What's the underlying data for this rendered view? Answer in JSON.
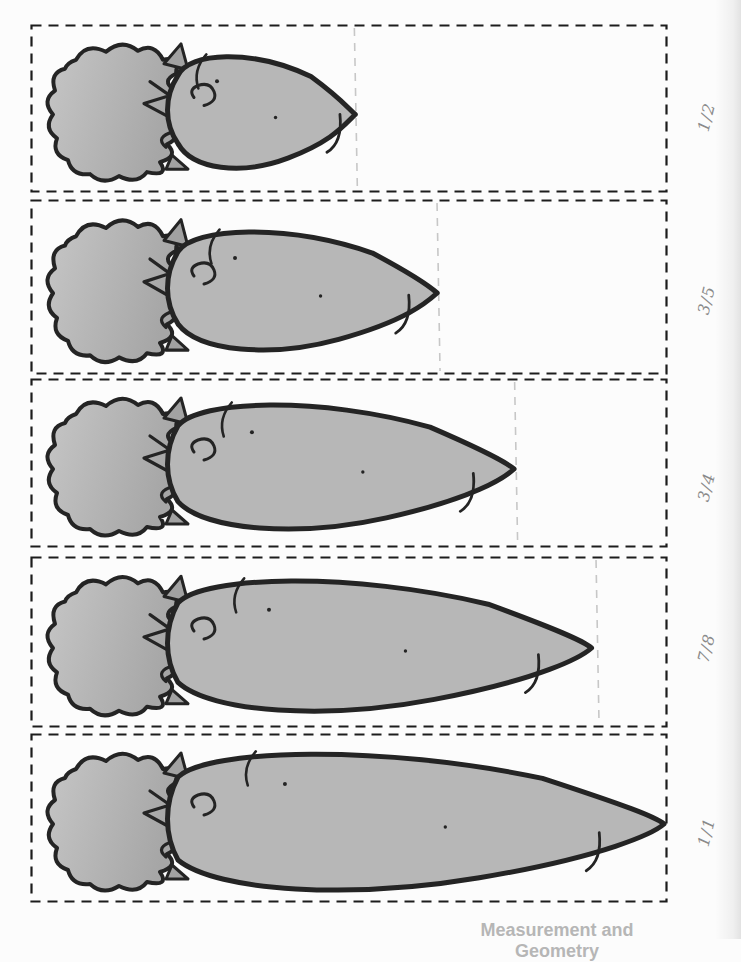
{
  "document": {
    "footer_label": "Measurement and Geometry"
  },
  "colors": {
    "page_background": "#fcfcfc",
    "carrot_fill": "#b7b7b7",
    "leaf_fill_light": "#c6c6c6",
    "leaf_fill_dark": "#a6a6a6",
    "leaf_spike_fill": "#a2a2a2",
    "outline_ink": "#242424",
    "box_border": "#1c1c1c",
    "guide_line": "#c7c7c7",
    "label_ink": "#8a8a8a",
    "footer_text": "#b6b6b6"
  },
  "rows": [
    {
      "label": "1/2",
      "numerator": 1,
      "denominator": 2,
      "length_fraction": 0.51,
      "guide_fraction": 0.51
    },
    {
      "label": "3/5",
      "numerator": 3,
      "denominator": 5,
      "length_fraction": 0.64,
      "guide_fraction": 0.64
    },
    {
      "label": "3/4",
      "numerator": 3,
      "denominator": 4,
      "length_fraction": 0.762,
      "guide_fraction": 0.762
    },
    {
      "label": "7/8",
      "numerator": 7,
      "denominator": 8,
      "length_fraction": 0.885,
      "guide_fraction": 0.89
    },
    {
      "label": "1/1",
      "numerator": 1,
      "denominator": 1,
      "length_fraction": 1.0,
      "guide_fraction": null
    }
  ]
}
